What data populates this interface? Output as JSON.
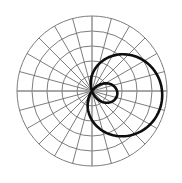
{
  "figure": {
    "title": "",
    "width": 182,
    "height": 183,
    "background_color": "#ffffff"
  },
  "chart_data": {
    "type": "line",
    "plot_style": "polar",
    "title": "",
    "subtitle": "",
    "xlabel": "",
    "ylabel": "",
    "grid": true,
    "legend": null,
    "legend_position": "none",
    "annotations": [],
    "tick_labels": {
      "radial": [],
      "angular": []
    },
    "polar_axes": {
      "center_x": 92,
      "center_y": 91,
      "outer_radius": 75,
      "radial_rings": 5,
      "ring_radii_px": [
        15,
        30,
        45,
        60,
        75
      ],
      "radial_range": [
        0,
        5
      ],
      "angular_spokes": 24,
      "angular_step_degrees": 15,
      "grid_color": "#6e6e6e",
      "axis_color": "#8a8a8a"
    },
    "series": [
      {
        "name": "limacon",
        "curve_type": "limacon-with-inner-loop",
        "equation": "r = a + b*cos(theta - phi)",
        "a": 1.5,
        "b": 3.2,
        "phi_degrees": -8,
        "color": "#0d0d0d",
        "line_width": 2.6,
        "theta_start_degrees": 0,
        "theta_end_degrees": 360,
        "r_max": 4.7,
        "r_min": -1.7,
        "inner_loop": true,
        "theta": [
          0,
          15,
          30,
          45,
          60,
          75,
          90,
          105,
          120,
          135,
          150,
          165,
          180,
          195,
          210,
          225,
          240,
          255,
          270,
          285,
          300,
          315,
          330,
          345,
          360
        ],
        "r": [
          4.67,
          4.62,
          4.38,
          3.96,
          3.38,
          2.68,
          1.94,
          1.17,
          0.44,
          -0.23,
          -0.78,
          -1.21,
          -1.48,
          -1.58,
          -1.52,
          -1.29,
          -0.92,
          -0.4,
          0.23,
          0.95,
          1.71,
          2.48,
          3.2,
          3.84,
          4.67
        ]
      }
    ]
  }
}
